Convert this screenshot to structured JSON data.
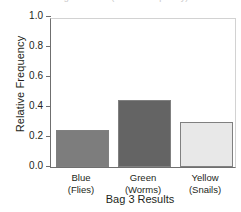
{
  "chart_data": {
    "type": "bar",
    "title": "Bag 3 Results (relative frequency)",
    "xlabel": "Bag 3 Results",
    "ylabel": "Relative Frequency",
    "categories": [
      "Blue",
      "Green",
      "Yellow"
    ],
    "category_sublabels": [
      "(Flies)",
      "(Worms)",
      "(Snails)"
    ],
    "values": [
      0.25,
      0.45,
      0.3
    ],
    "ylim": [
      0.0,
      1.0
    ],
    "yticks": [
      "0.0",
      "0.2",
      "0.4",
      "0.6",
      "0.8",
      "1.0"
    ],
    "ytick_values": [
      0.0,
      0.2,
      0.4,
      0.6,
      0.8,
      1.0
    ],
    "grid": false,
    "legend": "none",
    "bar_colors": [
      "#7d7d7d",
      "#646464",
      "#e8e8e8"
    ],
    "bar_edge_color": "#808080",
    "axis_color": "#6f6f6f",
    "frame_color": "#d2d2d2",
    "text_color": "#231f20",
    "background": "#ffffff"
  }
}
